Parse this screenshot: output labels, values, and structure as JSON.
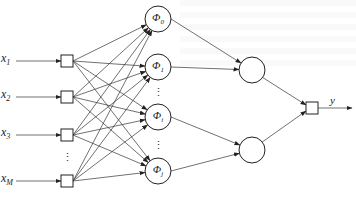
{
  "diagram": {
    "type": "rbf-neural-network",
    "colors": {
      "stroke": "#222222",
      "background": "#ffffff"
    },
    "inputs": [
      {
        "symbol": "x",
        "subscript": "1",
        "y": 61
      },
      {
        "symbol": "x",
        "subscript": "2",
        "y": 97
      },
      {
        "symbol": "x",
        "subscript": "3",
        "y": 135
      },
      {
        "symbol": "x",
        "subscript": "M",
        "y": 181
      }
    ],
    "input_ellipsis": "⋮",
    "hidden_nodes": [
      {
        "symbol": "Φ",
        "subscript": "0",
        "y": 19
      },
      {
        "symbol": "Φ",
        "subscript": "1",
        "y": 67
      },
      {
        "symbol": "Φ",
        "subscript": "i",
        "y": 117
      },
      {
        "symbol": "Φ",
        "subscript": "j",
        "y": 171
      }
    ],
    "hidden_ellipsis": [
      "⋮",
      "⋮"
    ],
    "middle_nodes": [
      {
        "y": 70
      },
      {
        "y": 150
      }
    ],
    "output": {
      "symbol": "y",
      "y": 108
    }
  }
}
